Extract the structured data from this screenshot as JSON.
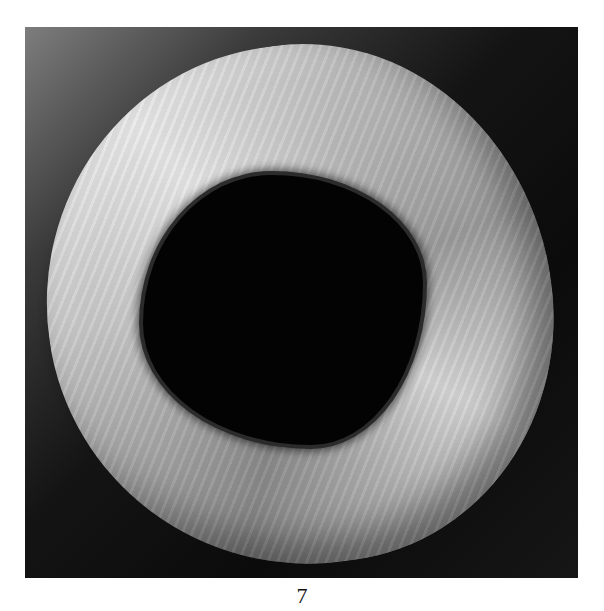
{
  "figure": {
    "background": "dark gradient, lighter at top-left",
    "caption": "7"
  }
}
